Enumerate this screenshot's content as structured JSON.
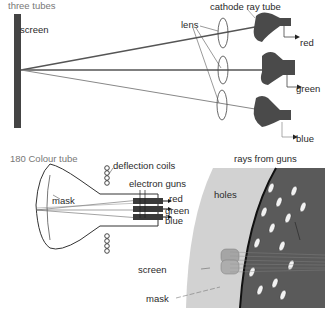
{
  "top_diagram": {
    "caption": "three tubes",
    "labels": {
      "screen": "screen",
      "lens": "lens",
      "cathode_ray_tube": "cathode ray tube",
      "red": "red",
      "green": "green",
      "blue": "blue"
    }
  },
  "bottom_diagram": {
    "caption": "180 Colour tube",
    "labels": {
      "deflection_coils": "deflection coils",
      "electron_guns": "electron guns",
      "mask": "mask",
      "red": "red",
      "green": "green",
      "blue": "blue"
    }
  },
  "detail_diagram": {
    "labels": {
      "rays_from_guns": "rays from guns",
      "holes": "holes",
      "screen": "screen",
      "mask": "mask"
    }
  },
  "colors": {
    "tube_fill": "#4a4a4a",
    "screen_bar": "#444444",
    "mask_light": "#d0d0d0",
    "mask_dark": "#5a5a5a"
  }
}
